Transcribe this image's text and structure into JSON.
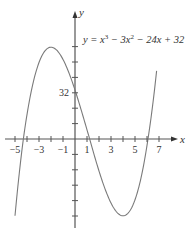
{
  "chart_data": {
    "type": "line",
    "equation": {
      "prefix": "y = x",
      "exp1": "3",
      "mid": " − 3x",
      "exp2": "2",
      "suffix": " − 24x + 32"
    },
    "xlabel": "x",
    "ylabel": "y",
    "function": "x^3 - 3x^2 - 24x + 32",
    "x_range": [
      -5,
      6.8
    ],
    "xlim": [
      -5,
      7
    ],
    "ylim": [
      -48,
      70
    ],
    "x_tick_labels": [
      "-5",
      "-3",
      "-1",
      "1",
      "3",
      "5",
      "7"
    ],
    "x_tick_label_values": [
      -5,
      -3,
      -1,
      1,
      3,
      5,
      7
    ],
    "x_ticks": [
      -5,
      -4,
      -3,
      -2,
      -1,
      1,
      2,
      3,
      4,
      5,
      6,
      7
    ],
    "y_tick_labels": [
      "32"
    ],
    "y_tick_label_values": [
      32
    ],
    "y_tick_step_approx": 10,
    "y_ticks_px_above": [
      1,
      2,
      3,
      4,
      5,
      6
    ],
    "y_ticks_px_below": [
      1,
      2,
      3,
      4,
      5
    ],
    "points": [
      {
        "x": -5,
        "y": -48
      },
      {
        "x": -4,
        "y": 16
      },
      {
        "x": -3,
        "y": 50
      },
      {
        "x": -2,
        "y": 60
      },
      {
        "x": -1,
        "y": 52
      },
      {
        "x": 0,
        "y": 32
      },
      {
        "x": 1,
        "y": 6
      },
      {
        "x": 2,
        "y": -20
      },
      {
        "x": 3,
        "y": -40
      },
      {
        "x": 4,
        "y": -48
      },
      {
        "x": 5,
        "y": -38
      },
      {
        "x": 6,
        "y": -4
      },
      {
        "x": 6.8,
        "y": 47
      }
    ],
    "local_max": {
      "x": -2,
      "y": 60
    },
    "local_min": {
      "x": 4,
      "y": -48
    },
    "grid": false,
    "line_color": "#7a7a7a",
    "axis_color": "#555555"
  }
}
